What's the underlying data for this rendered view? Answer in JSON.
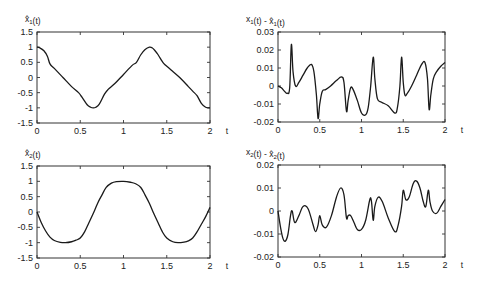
{
  "chart_data": [
    {
      "id": "xhat1",
      "type": "line",
      "title": "",
      "ylabel": "x̂1(t)",
      "ylabel_parts": {
        "base": "x̂",
        "sub": "1",
        "suffix": "(t)"
      },
      "xlabel": "t",
      "xlim": [
        0,
        2
      ],
      "ylim": [
        -1.5,
        1.5
      ],
      "xticks": [
        "0",
        "0.5",
        "1",
        "1.5",
        "2"
      ],
      "xtick_values": [
        0,
        0.5,
        1,
        1.5,
        2
      ],
      "yticks": [
        "1.5",
        "1",
        "0.5",
        "0",
        "-0.5",
        "-1",
        "-1.5"
      ],
      "ytick_values": [
        1.5,
        1,
        0.5,
        0,
        -0.5,
        -1,
        -1.5
      ],
      "grid": false,
      "frame": {
        "x0": 37,
        "x1": 210,
        "y0": 32,
        "y1": 123
      },
      "series": [
        {
          "name": "x̂1(t)",
          "x": [
            0,
            0.03,
            0.08,
            0.12,
            0.15,
            0.2,
            0.3,
            0.4,
            0.48,
            0.52,
            0.58,
            0.62,
            0.65,
            0.68,
            0.72,
            0.78,
            0.82,
            0.9,
            1.0,
            1.1,
            1.15,
            1.2,
            1.25,
            1.3,
            1.33,
            1.36,
            1.4,
            1.45,
            1.48,
            1.55,
            1.65,
            1.75,
            1.8,
            1.85,
            1.9,
            1.95,
            2.0
          ],
          "values": [
            1.0,
            0.98,
            0.88,
            0.7,
            0.45,
            0.3,
            0.0,
            -0.3,
            -0.5,
            -0.65,
            -0.9,
            -0.98,
            -1.0,
            -0.98,
            -0.88,
            -0.55,
            -0.4,
            -0.2,
            0.1,
            0.4,
            0.5,
            0.75,
            0.92,
            1.0,
            0.98,
            0.9,
            0.75,
            0.52,
            0.42,
            0.25,
            0.0,
            -0.3,
            -0.45,
            -0.6,
            -0.85,
            -0.98,
            -1.0
          ]
        }
      ]
    },
    {
      "id": "err1",
      "type": "line",
      "title": "",
      "ylabel": "x1(t) - x̂1(t)",
      "ylabel_parts": {
        "base": "x",
        "sub": "1",
        "mid": "(t) - ",
        "base2": "x̂",
        "sub2": "1",
        "suffix": "(t)"
      },
      "xlabel": "t",
      "xlim": [
        0,
        2
      ],
      "ylim": [
        -0.02,
        0.03
      ],
      "xticks": [
        "0",
        "0.5",
        "1",
        "1.5",
        "2"
      ],
      "xtick_values": [
        0,
        0.5,
        1,
        1.5,
        2
      ],
      "yticks": [
        "0.03",
        "0.02",
        "0.01",
        "0",
        "-0.01",
        "-0.02"
      ],
      "ytick_values": [
        0.03,
        0.02,
        0.01,
        0,
        -0.01,
        -0.02
      ],
      "grid": false,
      "frame": {
        "x0": 278,
        "x1": 445,
        "y0": 32,
        "y1": 122
      },
      "series": [
        {
          "name": "error 1",
          "x": [
            0,
            0.04,
            0.08,
            0.11,
            0.14,
            0.16,
            0.18,
            0.21,
            0.25,
            0.3,
            0.35,
            0.4,
            0.43,
            0.46,
            0.48,
            0.5,
            0.53,
            0.57,
            0.63,
            0.7,
            0.76,
            0.79,
            0.82,
            0.84,
            0.87,
            0.9,
            0.95,
            1.0,
            1.05,
            1.08,
            1.11,
            1.14,
            1.16,
            1.19,
            1.24,
            1.32,
            1.4,
            1.43,
            1.46,
            1.48,
            1.5,
            1.52,
            1.55,
            1.6,
            1.66,
            1.72,
            1.76,
            1.79,
            1.81,
            1.83,
            1.86,
            1.9,
            1.95,
            2.0
          ],
          "values": [
            0.0,
            -0.001,
            -0.003,
            -0.004,
            -0.001,
            0.023,
            0.008,
            0.0,
            0.002,
            0.006,
            0.01,
            0.012,
            0.008,
            -0.005,
            -0.018,
            -0.01,
            -0.003,
            -0.002,
            0.0,
            0.003,
            0.005,
            0.002,
            -0.014,
            -0.008,
            -0.001,
            -0.002,
            -0.008,
            -0.015,
            -0.016,
            -0.012,
            0.0,
            0.016,
            0.004,
            -0.007,
            -0.009,
            -0.011,
            -0.015,
            -0.012,
            0.0,
            0.016,
            0.002,
            -0.005,
            -0.004,
            0.0,
            0.006,
            0.012,
            0.013,
            0.004,
            -0.013,
            -0.005,
            0.004,
            0.008,
            0.011,
            0.013
          ]
        }
      ]
    },
    {
      "id": "xhat2",
      "type": "line",
      "title": "",
      "ylabel": "x̂2(t)",
      "ylabel_parts": {
        "base": "x̂",
        "sub": "2",
        "suffix": "(t)"
      },
      "xlabel": "t",
      "xlim": [
        0,
        2
      ],
      "ylim": [
        -1.5,
        1.5
      ],
      "xticks": [
        "0",
        "0.5",
        "1",
        "1.5",
        "2"
      ],
      "xtick_values": [
        0,
        0.5,
        1,
        1.5,
        2
      ],
      "yticks": [
        "1.5",
        "1",
        "0.5",
        "0",
        "-0.5",
        "-1",
        "-1.5"
      ],
      "ytick_values": [
        1.5,
        1,
        0.5,
        0,
        -0.5,
        -1,
        -1.5
      ],
      "grid": false,
      "frame": {
        "x0": 37,
        "x1": 210,
        "y0": 166,
        "y1": 258
      },
      "series": [
        {
          "name": "x̂2(t)",
          "x": [
            0,
            0.05,
            0.1,
            0.15,
            0.2,
            0.27,
            0.33,
            0.4,
            0.45,
            0.5,
            0.55,
            0.6,
            0.65,
            0.7,
            0.75,
            0.8,
            0.86,
            0.92,
            1.0,
            1.08,
            1.14,
            1.2,
            1.25,
            1.3,
            1.35,
            1.4,
            1.45,
            1.5,
            1.57,
            1.63,
            1.7,
            1.75,
            1.8,
            1.85,
            1.9,
            1.95,
            2.0
          ],
          "values": [
            0.0,
            -0.35,
            -0.62,
            -0.82,
            -0.93,
            -0.99,
            -1.0,
            -0.97,
            -0.92,
            -0.85,
            -0.65,
            -0.35,
            -0.05,
            0.28,
            0.55,
            0.8,
            0.94,
            0.99,
            1.0,
            0.97,
            0.92,
            0.8,
            0.55,
            0.28,
            -0.05,
            -0.35,
            -0.65,
            -0.85,
            -0.97,
            -1.0,
            -0.98,
            -0.94,
            -0.85,
            -0.65,
            -0.4,
            -0.15,
            0.15
          ]
        }
      ]
    },
    {
      "id": "err2",
      "type": "line",
      "title": "",
      "ylabel": "x2(t) - x̂2(t)",
      "ylabel_parts": {
        "base": "x",
        "sub": "2",
        "mid": "(t) - ",
        "base2": "x̂",
        "sub2": "2",
        "suffix": "(t)"
      },
      "xlabel": "t",
      "xlim": [
        0,
        2
      ],
      "ylim": [
        -0.02,
        0.02
      ],
      "xticks": [
        "0",
        "0.5",
        "1",
        "1.5",
        "2"
      ],
      "xtick_values": [
        0,
        0.5,
        1,
        1.5,
        2
      ],
      "yticks": [
        "0.02",
        "0.01",
        "0",
        "-0.01",
        "-0.02"
      ],
      "ytick_values": [
        0.02,
        0.01,
        0,
        -0.01,
        -0.02
      ],
      "grid": false,
      "frame": {
        "x0": 278,
        "x1": 445,
        "y0": 165,
        "y1": 257
      },
      "series": [
        {
          "name": "error 2",
          "x": [
            0,
            0.03,
            0.06,
            0.09,
            0.12,
            0.15,
            0.17,
            0.2,
            0.25,
            0.3,
            0.36,
            0.42,
            0.45,
            0.48,
            0.5,
            0.53,
            0.58,
            0.64,
            0.7,
            0.75,
            0.79,
            0.82,
            0.84,
            0.87,
            0.91,
            0.95,
            1.0,
            1.05,
            1.1,
            1.12,
            1.14,
            1.16,
            1.2,
            1.25,
            1.32,
            1.4,
            1.44,
            1.48,
            1.5,
            1.53,
            1.57,
            1.62,
            1.66,
            1.7,
            1.74,
            1.77,
            1.8,
            1.82,
            1.85,
            1.9,
            1.95,
            2.0
          ],
          "values": [
            0.0,
            -0.007,
            -0.012,
            -0.013,
            -0.01,
            -0.002,
            0.0,
            -0.005,
            -0.002,
            0.002,
            0.001,
            -0.006,
            -0.009,
            -0.006,
            -0.002,
            -0.006,
            -0.007,
            -0.002,
            0.006,
            0.01,
            0.007,
            -0.003,
            -0.002,
            -0.002,
            -0.005,
            -0.008,
            -0.008,
            -0.004,
            0.005,
            0.004,
            -0.004,
            0.002,
            0.006,
            0.004,
            -0.003,
            -0.009,
            -0.006,
            0.002,
            0.009,
            0.005,
            0.006,
            0.012,
            0.013,
            0.01,
            0.004,
            0.002,
            0.009,
            0.004,
            0.0,
            -0.001,
            0.002,
            0.005
          ]
        }
      ]
    }
  ]
}
